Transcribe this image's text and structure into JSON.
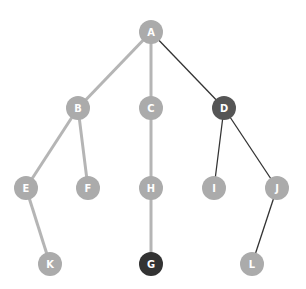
{
  "diagram": {
    "type": "tree",
    "colors": {
      "node_default": "#ababab",
      "node_highlight_mid": "#555555",
      "node_highlight_dark": "#333333",
      "edge_default": "#b5b5b5",
      "edge_highlight": "#333333",
      "label": "#ffffff"
    },
    "nodes": [
      {
        "id": "A",
        "label": "A",
        "x": 151,
        "y": 32,
        "style": "default"
      },
      {
        "id": "B",
        "label": "B",
        "x": 78,
        "y": 108,
        "style": "default"
      },
      {
        "id": "C",
        "label": "C",
        "x": 151,
        "y": 108,
        "style": "default"
      },
      {
        "id": "D",
        "label": "D",
        "x": 224,
        "y": 108,
        "style": "mid"
      },
      {
        "id": "E",
        "label": "E",
        "x": 26,
        "y": 188,
        "style": "default"
      },
      {
        "id": "F",
        "label": "F",
        "x": 88,
        "y": 188,
        "style": "default"
      },
      {
        "id": "H",
        "label": "H",
        "x": 151,
        "y": 188,
        "style": "default"
      },
      {
        "id": "I",
        "label": "I",
        "x": 214,
        "y": 188,
        "style": "default"
      },
      {
        "id": "J",
        "label": "J",
        "x": 277,
        "y": 188,
        "style": "default"
      },
      {
        "id": "K",
        "label": "K",
        "x": 50,
        "y": 264,
        "style": "default"
      },
      {
        "id": "G",
        "label": "G",
        "x": 151,
        "y": 264,
        "style": "dark"
      },
      {
        "id": "L",
        "label": "L",
        "x": 252,
        "y": 264,
        "style": "default"
      }
    ],
    "edges": [
      {
        "from": "A",
        "to": "B",
        "style": "default"
      },
      {
        "from": "A",
        "to": "C",
        "style": "default"
      },
      {
        "from": "A",
        "to": "D",
        "style": "highlight"
      },
      {
        "from": "B",
        "to": "E",
        "style": "default"
      },
      {
        "from": "B",
        "to": "F",
        "style": "default"
      },
      {
        "from": "C",
        "to": "H",
        "style": "default"
      },
      {
        "from": "D",
        "to": "I",
        "style": "highlight"
      },
      {
        "from": "D",
        "to": "J",
        "style": "highlight"
      },
      {
        "from": "E",
        "to": "K",
        "style": "default"
      },
      {
        "from": "H",
        "to": "G",
        "style": "default"
      },
      {
        "from": "J",
        "to": "L",
        "style": "highlight"
      }
    ]
  }
}
